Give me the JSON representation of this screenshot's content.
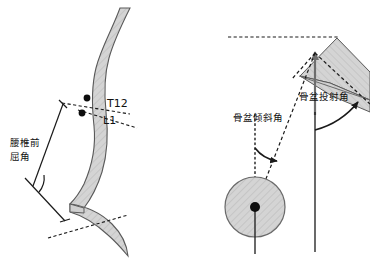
{
  "figure": {
    "title": "",
    "background_color": "#ffffff",
    "width": 370,
    "height": 260,
    "bone_fill_color": "#d2d2d2",
    "bone_stroke_color": "#5a5a5a",
    "line_color": "#1a1a1a",
    "panels": [
      {
        "id": "left-panel",
        "name": "lumbar-anteflexion-angle-diagram",
        "description": "Lateral lumbar spine with sacrum, showing the lumbar anteflexion angle between the T12/L1 endplate line and the sacral endplate line",
        "markers": [
          {
            "id": "t12",
            "label": "T12",
            "x": 91,
            "y": 103
          },
          {
            "id": "l1",
            "label": "L1",
            "x": 86,
            "y": 117
          }
        ],
        "angle_label": {
          "id": "lumbar-anteflexion-angle",
          "lines": [
            "腰椎前",
            "屈角"
          ],
          "line1": "腰椎前",
          "line2": "屈角",
          "full": "腰椎前屈角",
          "meaning": "lumbar anteflexion angle"
        }
      },
      {
        "id": "right-panel",
        "name": "pelvic-parameters-diagram",
        "description": "Pelvis with femoral head, sacral plate, horizontal reference and vertical reference, showing pelvic incidence and pelvic tilt",
        "angle_labels": [
          {
            "id": "pelvic-incidence-angle",
            "text": "骨盆投射角",
            "meaning": "pelvic incidence angle",
            "x": 299,
            "y": 100
          },
          {
            "id": "pelvic-tilt-angle",
            "text": "骨盆倾斜角",
            "meaning": "pelvic tilt angle",
            "x": 233,
            "y": 121
          }
        ],
        "femoral_head": {
          "id": "femoral-head",
          "center_x": 255,
          "center_y": 207,
          "radius": 30
        }
      }
    ]
  }
}
